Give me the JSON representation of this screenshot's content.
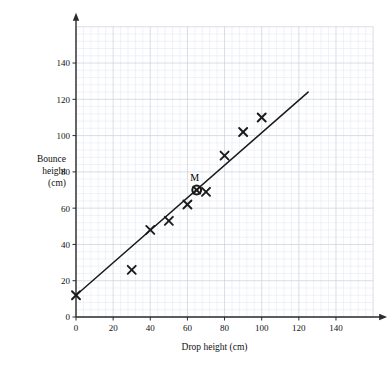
{
  "chart_data": {
    "type": "scatter",
    "title": "",
    "xlabel": "Drop height (cm)",
    "ylabel": "Bounce height (cm)",
    "ylabel_lines": [
      "Bounce",
      "height",
      "(cm)"
    ],
    "xlim": [
      0,
      160
    ],
    "ylim": [
      0,
      160
    ],
    "x_ticks": [
      0,
      20,
      40,
      60,
      80,
      100,
      120,
      140
    ],
    "y_ticks": [
      0,
      20,
      40,
      60,
      80,
      100,
      120,
      140
    ],
    "x_tick_labels": [
      "0",
      "20",
      "40",
      "60",
      "80",
      "100",
      "120",
      "140"
    ],
    "y_tick_labels": [
      "0",
      "20",
      "40",
      "60",
      "80",
      "100",
      "120",
      "140"
    ],
    "grid": true,
    "grid_major_step": 20,
    "grid_minor_step": 4,
    "legend": "none",
    "marker": "x",
    "series": [
      {
        "name": "Bounce height vs drop height",
        "marker": "x",
        "points": [
          {
            "x": 0,
            "y": 12
          },
          {
            "x": 30,
            "y": 26
          },
          {
            "x": 40,
            "y": 48
          },
          {
            "x": 50,
            "y": 53
          },
          {
            "x": 60,
            "y": 62
          },
          {
            "x": 70,
            "y": 69
          },
          {
            "x": 80,
            "y": 89
          },
          {
            "x": 90,
            "y": 102
          },
          {
            "x": 100,
            "y": 110
          }
        ]
      }
    ],
    "annotations": [
      {
        "name": "mean-point",
        "label": "M",
        "x": 65,
        "y": 70,
        "marker": "circled-cross"
      }
    ],
    "trend_line": {
      "name": "line of best fit",
      "x_start": 0,
      "y_start": 12,
      "x_end": 125,
      "y_end": 124
    },
    "colors": {
      "axis": "#2b2b2b",
      "grid_major": "#c9cfdd",
      "grid_minor": "#e6eaf2",
      "marker": "#1a1a1a",
      "trend_line": "#1a1a1a",
      "background": "#ffffff"
    }
  }
}
